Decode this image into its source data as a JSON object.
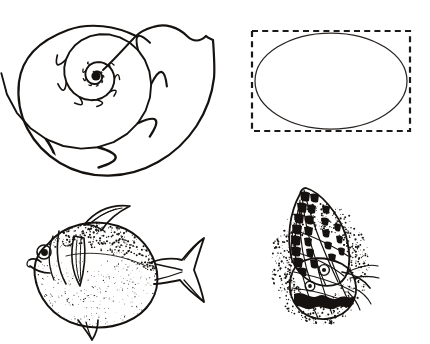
{
  "figure": {
    "background_color": "#ffffff",
    "ink_color": "#16120f",
    "width": 430,
    "height": 344,
    "panel_count": 4
  },
  "panels": [
    {
      "id": "shell",
      "name": "Nautilus shell cross-section",
      "caption": "",
      "position": "top-left",
      "subject": "chambered nautilus shell sectioned to reveal logarithmic spiral of septa",
      "style": "black ink outline drawing",
      "bounds": {
        "x": 8,
        "y": 6,
        "width": 215,
        "height": 175
      },
      "chamber_count": 32,
      "spiral_center": {
        "x": 88,
        "y": 70
      },
      "growth_factor": 1.13,
      "stroke_width": 1.6
    },
    {
      "id": "ellipse-in-box",
      "name": "Ellipse inscribed in dashed rectangle",
      "caption": "",
      "position": "top-right",
      "subject": "geometric ellipse inscribed within a dashed bounding rectangle",
      "style": "thin solid ellipse with dashed rectangle",
      "bounds": {
        "x": 240,
        "y": 20,
        "width": 185,
        "height": 125
      },
      "rectangle": {
        "x": 252,
        "y": 31,
        "width": 158,
        "height": 100
      },
      "ellipse": {
        "cx": 331,
        "cy": 81,
        "rx": 76,
        "ry": 48
      },
      "dash_pattern": "6 4.2",
      "dash_stroke_width": 2.2,
      "ellipse_stroke_width": 1.25
    },
    {
      "id": "fish",
      "name": "Pomfret fish",
      "caption": "",
      "position": "bottom-left",
      "subject": "deep-bodied pomfret or moonfish in left-facing lateral view",
      "style": "stippled pen and ink engraving",
      "bounds": {
        "x": 12,
        "y": 200,
        "width": 195,
        "height": 142
      },
      "features": [
        "eye",
        "mouth",
        "gill-cover",
        "dorsal-fin",
        "pectoral-fin",
        "forked-caudal-fin",
        "pelvic-fin",
        "stippled-flank"
      ]
    },
    {
      "id": "butterfly",
      "name": "Butterfly with folded wings",
      "caption": "",
      "position": "bottom-right",
      "subject": "butterfly at rest in side view with checkered forewing raised over rounded hindwing",
      "style": "stippled pen and ink engraving",
      "bounds": {
        "x": 270,
        "y": 172,
        "width": 110,
        "height": 155
      },
      "features": [
        "forewing",
        "hindwing",
        "checkered-margin",
        "wing-veins",
        "eyespot",
        "antenna",
        "body"
      ]
    }
  ],
  "icons": {
    "shell": "nautilus-shell-icon",
    "ellipse": "ellipse-icon",
    "rectangle": "dashed-rectangle-icon",
    "fish": "fish-icon",
    "butterfly": "butterfly-icon"
  }
}
